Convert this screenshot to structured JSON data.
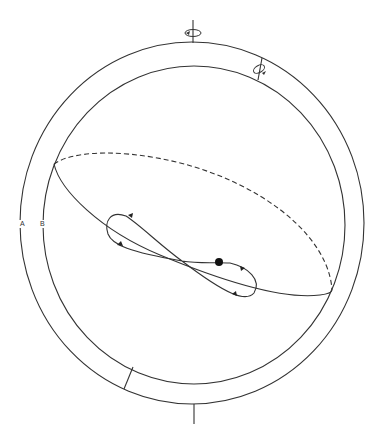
{
  "diagram": {
    "title": "",
    "labels": {
      "outer_ring": "A",
      "inner_ring": "B"
    },
    "colors": {
      "stroke": "#333333",
      "background": "#ffffff",
      "dot": "#111111"
    },
    "elements": [
      "outer-ring",
      "inner-ring",
      "top-axis-with-rotation-arrow",
      "tilted-axis-with-rotation-arrow",
      "bottom-axis",
      "orbit-ellipse-front-solid",
      "orbit-ellipse-back-dashed",
      "figure-eight-path-with-direction-arrows",
      "moving-body-dot"
    ]
  }
}
